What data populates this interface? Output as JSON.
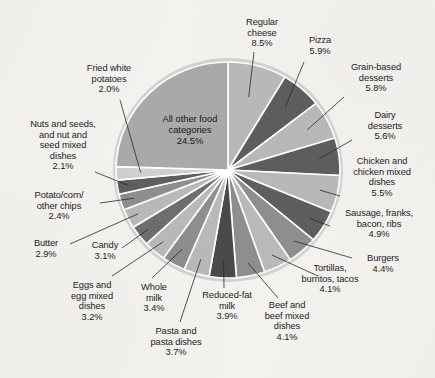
{
  "figure": {
    "background_color": "#f3f2ef",
    "text_color": "#1d1d1d",
    "center_label": "All other food\ncategories\n24.5%"
  },
  "chart_data": {
    "type": "pie",
    "title": "",
    "subtitle": "",
    "xlabel": "",
    "ylabel": "",
    "units": "percent",
    "legend_position": "none",
    "grid": false,
    "start_angle_deg": 0,
    "direction": "clockwise",
    "center_px": [
      228,
      170
    ],
    "radius_px": 110,
    "colors": {
      "light": "#b9b9b9",
      "dark": "#5e5e5e",
      "major": "#a9a9a9",
      "separator": "#ffffff",
      "rim": "#cfcecb"
    },
    "labels": [
      "Regular cheese",
      "Pizza",
      "Grain-based desserts",
      "Dairy desserts",
      "Chicken and chicken mixed dishes",
      "Sausage, franks, bacon, ribs",
      "Burgers",
      "Tortillas, burritos, tacos",
      "Beef and beef mixed dishes",
      "Reduced-fat milk",
      "Pasta and pasta dishes",
      "Whole milk",
      "Eggs and egg mixed dishes",
      "Candy",
      "Butter",
      "Potato/corn/other chips",
      "Nuts and seeds, and nut and seed mixed dishes",
      "Fried white potatoes",
      "All other food categories"
    ],
    "values": [
      8.5,
      5.9,
      5.8,
      5.6,
      5.5,
      4.9,
      4.4,
      4.1,
      4.1,
      3.9,
      3.7,
      3.4,
      3.2,
      3.1,
      2.9,
      2.4,
      2.1,
      2.0,
      24.5
    ],
    "slices": [
      {
        "label": "Regular cheese",
        "value": 8.5,
        "value_text": "8.5%",
        "color": "#b9b9b9"
      },
      {
        "label": "Pizza",
        "value": 5.9,
        "value_text": "5.9%",
        "color": "#5e5e5e"
      },
      {
        "label": "Grain-based desserts",
        "value": 5.8,
        "value_text": "5.8%",
        "color": "#b9b9b9"
      },
      {
        "label": "Dairy desserts",
        "value": 5.6,
        "value_text": "5.6%",
        "color": "#5e5e5e"
      },
      {
        "label": "Chicken and chicken mixed dishes",
        "value": 5.5,
        "value_text": "5.5%",
        "color": "#b9b9b9"
      },
      {
        "label": "Sausage, franks, bacon, ribs",
        "value": 4.9,
        "value_text": "4.9%",
        "color": "#5e5e5e"
      },
      {
        "label": "Burgers",
        "value": 4.4,
        "value_text": "4.4%",
        "color": "#8e8e8e"
      },
      {
        "label": "Tortillas, burritos, tacos",
        "value": 4.1,
        "value_text": "4.1%",
        "color": "#b9b9b9"
      },
      {
        "label": "Beef and beef mixed dishes",
        "value": 4.1,
        "value_text": "4.1%",
        "color": "#8e8e8e"
      },
      {
        "label": "Reduced-fat milk",
        "value": 3.9,
        "value_text": "3.9%",
        "color": "#4a4a4a"
      },
      {
        "label": "Pasta and pasta dishes",
        "value": 3.7,
        "value_text": "3.7%",
        "color": "#b9b9b9"
      },
      {
        "label": "Whole milk",
        "value": 3.4,
        "value_text": "3.4%",
        "color": "#8e8e8e"
      },
      {
        "label": "Eggs and egg mixed dishes",
        "value": 3.2,
        "value_text": "3.2%",
        "color": "#b9b9b9"
      },
      {
        "label": "Candy",
        "value": 3.1,
        "value_text": "3.1%",
        "color": "#6e6e6e"
      },
      {
        "label": "Butter",
        "value": 2.9,
        "value_text": "2.9%",
        "color": "#b9b9b9"
      },
      {
        "label": "Potato/corn/other chips",
        "value": 2.4,
        "value_text": "2.4%",
        "color": "#8e8e8e"
      },
      {
        "label": "Nuts and seeds, and nut and seed mixed dishes",
        "value": 2.1,
        "value_text": "2.1%",
        "color": "#5e5e5e"
      },
      {
        "label": "Fried white potatoes",
        "value": 2.0,
        "value_text": "2.0%",
        "color": "#cfcfcf"
      },
      {
        "label": "All other food categories",
        "value": 24.5,
        "value_text": "24.5%",
        "color": "#a9a9a9"
      }
    ]
  },
  "callouts": [
    {
      "key": "regular-cheese",
      "text": "Regular\ncheese\n8.5%"
    },
    {
      "key": "pizza",
      "text": "Pizza\n5.9%"
    },
    {
      "key": "grain-desserts",
      "text": "Grain-based\ndesserts\n5.8%"
    },
    {
      "key": "dairy-desserts",
      "text": "Dairy\ndesserts\n5.6%"
    },
    {
      "key": "chicken",
      "text": "Chicken and\nchicken mixed\ndishes\n5.5%"
    },
    {
      "key": "sausage",
      "text": "Sausage, franks,\nbacon, ribs\n4.9%"
    },
    {
      "key": "burgers",
      "text": "Burgers\n4.4%"
    },
    {
      "key": "tortillas",
      "text": "Tortillas,\nburritos, tacos\n4.1%"
    },
    {
      "key": "beef",
      "text": "Beef and\nbeef mixed\ndishes\n4.1%"
    },
    {
      "key": "reduced-fat-milk",
      "text": "Reduced-fat\nmilk\n3.9%"
    },
    {
      "key": "pasta",
      "text": "Pasta and\npasta dishes\n3.7%"
    },
    {
      "key": "whole-milk",
      "text": "Whole\nmilk\n3.4%"
    },
    {
      "key": "eggs",
      "text": "Eggs and\negg mixed\ndishes\n3.2%"
    },
    {
      "key": "candy",
      "text": "Candy\n3.1%"
    },
    {
      "key": "butter",
      "text": "Butter\n2.9%"
    },
    {
      "key": "chips",
      "text": "Potato/corn/\nother chips\n2.4%"
    },
    {
      "key": "nuts",
      "text": "Nuts and seeds,\nand nut and\nseed mixed\ndishes\n2.1%"
    },
    {
      "key": "fried-potatoes",
      "text": "Fried white\npotatoes\n2.0%"
    }
  ]
}
